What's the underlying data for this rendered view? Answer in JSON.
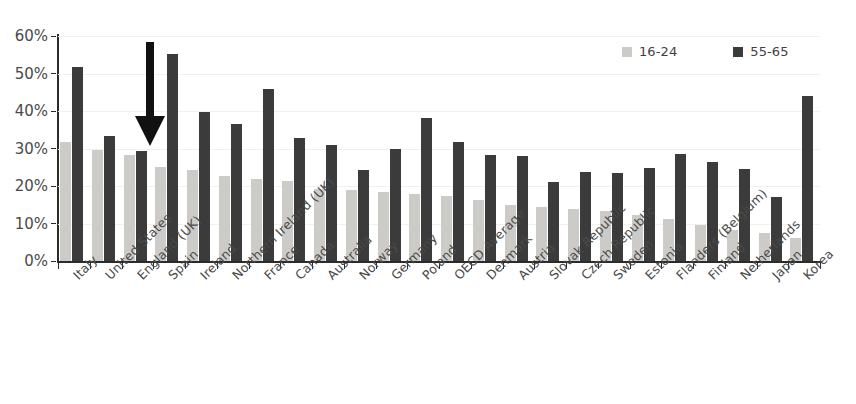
{
  "chart_data": {
    "type": "bar",
    "title": "",
    "xlabel": "",
    "ylabel": "",
    "ylim": [
      0,
      60
    ],
    "ytick_labels": [
      "60%",
      "50%",
      "40%",
      "30%",
      "20%",
      "10%",
      "0%"
    ],
    "ytick_values": [
      60,
      50,
      40,
      30,
      20,
      10,
      0
    ],
    "grid": true,
    "legend_position": "top-right",
    "categories": [
      "Italy",
      "United States",
      "England (UK)",
      "Spain",
      "Ireland",
      "Northern Ireland (UK)",
      "France",
      "Canada",
      "Australia",
      "Norway",
      "Germany",
      "Poland",
      "OECD Average",
      "Denmark",
      "Austria",
      "Slovak Republic",
      "Czech Republic",
      "Sweden",
      "Estonia",
      "Flanders (Belgium)",
      "Finland",
      "Netherlands",
      "Japan",
      "Korea"
    ],
    "series": [
      {
        "name": "16-24",
        "color": "#cdcbc7",
        "values": [
          31.8,
          29.5,
          28.3,
          25.0,
          24.2,
          22.7,
          22.0,
          21.3,
          19.2,
          18.9,
          18.4,
          17.9,
          17.4,
          16.2,
          15.0,
          14.3,
          13.9,
          13.3,
          12.4,
          11.2,
          9.6,
          8.3,
          7.6,
          6.2
        ]
      },
      {
        "name": "55-65",
        "color": "#3b3b3b",
        "values": [
          51.7,
          33.4,
          29.3,
          55.3,
          39.8,
          36.5,
          45.9,
          32.8,
          31.0,
          24.3,
          29.9,
          38.2,
          31.8,
          28.2,
          27.9,
          21.0,
          23.8,
          23.6,
          24.9,
          28.6,
          26.4,
          24.6,
          17.0,
          44.0
        ]
      }
    ]
  },
  "legend": {
    "items": [
      {
        "label": "16-24",
        "color": "#cdcbc7"
      },
      {
        "label": "55-65",
        "color": "#3b3b3b"
      }
    ]
  },
  "annotation": {
    "arrow": {
      "name": "down-arrow-annotation",
      "points_to": "England (UK)",
      "color": "#111111"
    }
  }
}
